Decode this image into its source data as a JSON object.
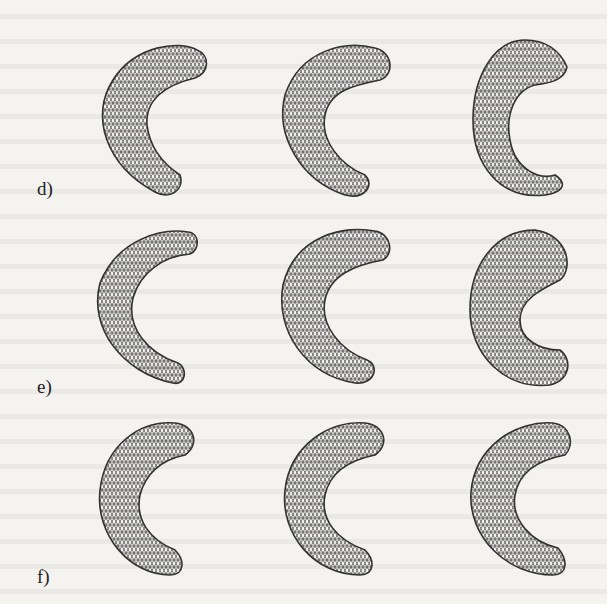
{
  "figure": {
    "rows": [
      {
        "label": "d)",
        "meshes": [
          "mesh-d-1",
          "mesh-d-2",
          "mesh-d-3"
        ]
      },
      {
        "label": "e)",
        "meshes": [
          "mesh-e-1",
          "mesh-e-2",
          "mesh-e-3"
        ]
      },
      {
        "label": "f)",
        "meshes": [
          "mesh-f-1",
          "mesh-f-2",
          "mesh-f-3"
        ]
      }
    ],
    "mesh_color": "#3a3a3a",
    "background_color": "#f4f3f0"
  }
}
